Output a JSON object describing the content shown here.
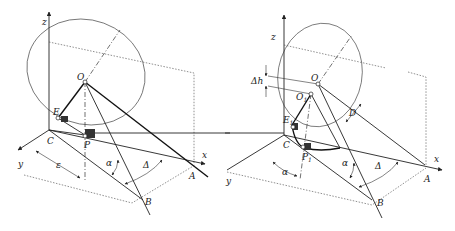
{
  "figure": {
    "left": {
      "labels": {
        "z": "z",
        "y": "y",
        "x": "x",
        "O": "O",
        "E": "E",
        "C": "C",
        "P": "P",
        "A": "A",
        "B": "B",
        "alpha": "α",
        "delta": "Δ",
        "epsilon": "ε"
      }
    },
    "right": {
      "labels": {
        "z": "z",
        "y": "y",
        "x": "x",
        "O": "O",
        "O1": "O",
        "O1_sub": "1",
        "E1": "E",
        "E1_sub": "1",
        "C": "C",
        "P1": "P",
        "P1_sub": "1",
        "A": "A",
        "B": "B",
        "alpha1": "α",
        "alpha2": "α",
        "delta": "Δ",
        "D": "D",
        "dh": "Δh"
      }
    }
  }
}
